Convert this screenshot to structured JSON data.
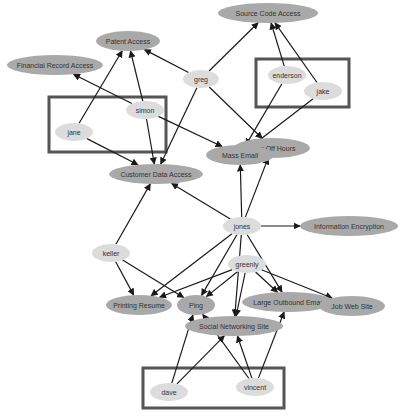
{
  "diagram": {
    "type": "directed-graph",
    "colors": {
      "resource_fill": "#a9a9a9",
      "person_fill": "#dcdcdc",
      "edge": "#1a1a1a",
      "group_border": "#555555",
      "label": "#333333"
    },
    "groups": [
      {
        "id": "group-simon-jane",
        "x": 49,
        "y": 97,
        "w": 117,
        "h": 55,
        "members": [
          "simon",
          "jane"
        ]
      },
      {
        "id": "group-enderson-jake",
        "x": 256,
        "y": 59,
        "w": 93,
        "h": 48,
        "members": [
          "enderson",
          "jake"
        ]
      },
      {
        "id": "group-dave-vincent",
        "x": 143,
        "y": 368,
        "w": 141,
        "h": 40,
        "members": [
          "dave",
          "vincent"
        ]
      }
    ],
    "nodes": [
      {
        "id": "source-code-access",
        "label": "Source Code Access",
        "kind": "resource",
        "cx": 268,
        "cy": 13,
        "rx": 50,
        "ry": 10
      },
      {
        "id": "patent-access",
        "label": "Patent Access",
        "kind": "resource",
        "cx": 128,
        "cy": 41,
        "rx": 32,
        "ry": 10
      },
      {
        "id": "financial-record-access",
        "label": "Financial Record Access",
        "kind": "resource",
        "cx": 55,
        "cy": 65,
        "rx": 48,
        "ry": 10
      },
      {
        "id": "greg",
        "label": "greg",
        "kind": "person",
        "cx": 201,
        "cy": 79,
        "rx": 18,
        "ry": 9
      },
      {
        "id": "enderson",
        "label": "enderson",
        "kind": "person",
        "cx": 287,
        "cy": 75,
        "rx": 19,
        "ry": 9
      },
      {
        "id": "jake",
        "label": "jake",
        "kind": "person",
        "cx": 323,
        "cy": 91,
        "rx": 19,
        "ry": 9
      },
      {
        "id": "simon",
        "label": "simon",
        "kind": "person",
        "cx": 145,
        "cy": 110,
        "rx": 19,
        "ry": 9
      },
      {
        "id": "jane",
        "label": "jane",
        "kind": "person",
        "cx": 74,
        "cy": 132,
        "rx": 19,
        "ry": 9
      },
      {
        "id": "off-hours",
        "label": "Printing Off Hours",
        "visible_label": "nting Off Hours",
        "kind": "resource",
        "cx": 272,
        "cy": 148,
        "rx": 38,
        "ry": 10
      },
      {
        "id": "mass-email",
        "label": "Mass Email",
        "kind": "resource",
        "cx": 240,
        "cy": 155,
        "rx": 34,
        "ry": 10
      },
      {
        "id": "customer-data-access",
        "label": "Customer Data Access",
        "kind": "resource",
        "cx": 156,
        "cy": 174,
        "rx": 47,
        "ry": 10
      },
      {
        "id": "jones",
        "label": "jones",
        "kind": "person",
        "cx": 242,
        "cy": 226,
        "rx": 19,
        "ry": 9
      },
      {
        "id": "information-encryption",
        "label": "Information Encryption",
        "kind": "resource",
        "cx": 349,
        "cy": 226,
        "rx": 49,
        "ry": 10
      },
      {
        "id": "keller",
        "label": "keller",
        "kind": "person",
        "cx": 111,
        "cy": 253,
        "rx": 19,
        "ry": 9
      },
      {
        "id": "greenly",
        "label": "greenly",
        "kind": "person",
        "cx": 247,
        "cy": 264,
        "rx": 19,
        "ry": 9
      },
      {
        "id": "printing-resume",
        "label": "Printing Resume",
        "kind": "resource",
        "cx": 139,
        "cy": 305,
        "rx": 33,
        "ry": 10
      },
      {
        "id": "large-outbound-email",
        "label": "Large Outbound Email",
        "visible_label": "Large Outbound Ema¹",
        "kind": "resource",
        "cx": 288,
        "cy": 302,
        "rx": 46,
        "ry": 10
      },
      {
        "id": "job-web-site",
        "label": "Job Web Site",
        "kind": "resource",
        "cx": 352,
        "cy": 306,
        "rx": 33,
        "ry": 10
      },
      {
        "id": "social-networking-site",
        "label": "Social Networking Site",
        "kind": "resource",
        "cx": 234,
        "cy": 326,
        "rx": 49,
        "ry": 10
      },
      {
        "id": "ping",
        "label": "Ping",
        "kind": "resource",
        "cx": 196,
        "cy": 305,
        "rx": 19,
        "ry": 10
      },
      {
        "id": "dave",
        "label": "dave",
        "kind": "person",
        "cx": 169,
        "cy": 392,
        "rx": 19,
        "ry": 9
      },
      {
        "id": "vincent",
        "label": "vincent",
        "kind": "person",
        "cx": 255,
        "cy": 387,
        "rx": 19,
        "ry": 9
      }
    ],
    "edges": [
      {
        "from": "greg",
        "to": "source-code-access"
      },
      {
        "from": "greg",
        "to": "patent-access"
      },
      {
        "from": "greg",
        "to": "customer-data-access"
      },
      {
        "from": "greg",
        "to": "off-hours"
      },
      {
        "from": "enderson",
        "to": "source-code-access"
      },
      {
        "from": "enderson",
        "to": "mass-email"
      },
      {
        "from": "jake",
        "to": "source-code-access"
      },
      {
        "from": "jake",
        "to": "mass-email"
      },
      {
        "from": "simon",
        "to": "patent-access"
      },
      {
        "from": "simon",
        "to": "financial-record-access"
      },
      {
        "from": "simon",
        "to": "customer-data-access"
      },
      {
        "from": "simon",
        "to": "mass-email"
      },
      {
        "from": "jane",
        "to": "patent-access"
      },
      {
        "from": "jane",
        "to": "customer-data-access"
      },
      {
        "from": "jones",
        "to": "mass-email"
      },
      {
        "from": "jones",
        "to": "off-hours"
      },
      {
        "from": "jones",
        "to": "customer-data-access"
      },
      {
        "from": "jones",
        "to": "information-encryption"
      },
      {
        "from": "jones",
        "to": "ping"
      },
      {
        "from": "jones",
        "to": "social-networking-site"
      },
      {
        "from": "jones",
        "to": "large-outbound-email"
      },
      {
        "from": "jones",
        "to": "printing-resume"
      },
      {
        "from": "keller",
        "to": "customer-data-access"
      },
      {
        "from": "keller",
        "to": "printing-resume"
      },
      {
        "from": "keller",
        "to": "ping"
      },
      {
        "from": "greenly",
        "to": "printing-resume"
      },
      {
        "from": "greenly",
        "to": "ping"
      },
      {
        "from": "greenly",
        "to": "social-networking-site"
      },
      {
        "from": "greenly",
        "to": "large-outbound-email"
      },
      {
        "from": "greenly",
        "to": "job-web-site"
      },
      {
        "from": "dave",
        "to": "ping"
      },
      {
        "from": "dave",
        "to": "social-networking-site"
      },
      {
        "from": "vincent",
        "to": "ping"
      },
      {
        "from": "vincent",
        "to": "social-networking-site"
      },
      {
        "from": "vincent",
        "to": "large-outbound-email"
      }
    ]
  }
}
